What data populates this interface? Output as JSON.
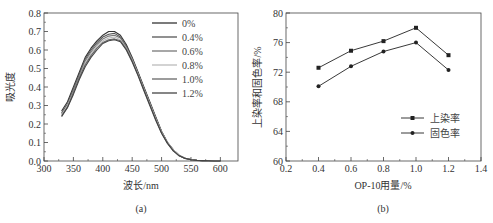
{
  "chart_data": [
    {
      "id": "a",
      "type": "line",
      "caption": "(a)",
      "title": "",
      "xlabel": "波长/nm",
      "ylabel": "吸光度",
      "xlim": [
        300,
        630
      ],
      "ylim": [
        0.0,
        0.8
      ],
      "xticks": [
        300,
        350,
        400,
        450,
        500,
        550,
        600
      ],
      "xtick_labels": [
        "300",
        "350",
        "400",
        "450",
        "500",
        "550",
        "600"
      ],
      "yticks": [
        0.0,
        0.1,
        0.2,
        0.3,
        0.4,
        0.5,
        0.6,
        0.7,
        0.8
      ],
      "ytick_labels": [
        "0.0",
        "0.1",
        "0.2",
        "0.3",
        "0.4",
        "0.5",
        "0.6",
        "0.7",
        "0.8"
      ],
      "grid": false,
      "legend_position": "upper right",
      "x": [
        330,
        340,
        350,
        360,
        370,
        380,
        390,
        400,
        410,
        420,
        430,
        440,
        450,
        460,
        470,
        480,
        490,
        500,
        510,
        520,
        530,
        540,
        550,
        560,
        570,
        580,
        590,
        600
      ],
      "series": [
        {
          "name": "0%",
          "color": "#333333",
          "values": [
            0.27,
            0.32,
            0.4,
            0.48,
            0.56,
            0.61,
            0.65,
            0.68,
            0.7,
            0.7,
            0.68,
            0.63,
            0.56,
            0.48,
            0.4,
            0.32,
            0.24,
            0.16,
            0.1,
            0.06,
            0.03,
            0.015,
            0.008,
            0.004,
            0.002,
            0.001,
            0.0,
            0.0
          ]
        },
        {
          "name": "0.4%",
          "color": "#555555",
          "values": [
            0.26,
            0.31,
            0.39,
            0.47,
            0.55,
            0.6,
            0.64,
            0.67,
            0.685,
            0.69,
            0.67,
            0.62,
            0.555,
            0.475,
            0.395,
            0.315,
            0.235,
            0.16,
            0.1,
            0.06,
            0.03,
            0.015,
            0.008,
            0.004,
            0.002,
            0.001,
            0.0,
            0.0
          ]
        },
        {
          "name": "0.6%",
          "color": "#777777",
          "values": [
            0.255,
            0.3,
            0.38,
            0.46,
            0.54,
            0.59,
            0.63,
            0.66,
            0.675,
            0.68,
            0.665,
            0.615,
            0.55,
            0.47,
            0.39,
            0.31,
            0.23,
            0.155,
            0.1,
            0.06,
            0.03,
            0.015,
            0.008,
            0.004,
            0.002,
            0.001,
            0.0,
            0.0
          ]
        },
        {
          "name": "0.8%",
          "color": "#bbbbbb",
          "values": [
            0.25,
            0.3,
            0.37,
            0.45,
            0.53,
            0.58,
            0.62,
            0.65,
            0.665,
            0.67,
            0.655,
            0.61,
            0.545,
            0.47,
            0.39,
            0.31,
            0.23,
            0.155,
            0.1,
            0.06,
            0.03,
            0.015,
            0.008,
            0.004,
            0.002,
            0.001,
            0.0,
            0.0
          ]
        },
        {
          "name": "1.0%",
          "color": "#666666",
          "values": [
            0.245,
            0.29,
            0.37,
            0.45,
            0.52,
            0.57,
            0.61,
            0.64,
            0.655,
            0.66,
            0.65,
            0.605,
            0.54,
            0.465,
            0.385,
            0.305,
            0.225,
            0.15,
            0.095,
            0.055,
            0.028,
            0.014,
            0.007,
            0.003,
            0.002,
            0.001,
            0.0,
            0.0
          ]
        },
        {
          "name": "1.2%",
          "color": "#444444",
          "values": [
            0.24,
            0.29,
            0.36,
            0.44,
            0.51,
            0.56,
            0.6,
            0.635,
            0.65,
            0.655,
            0.645,
            0.6,
            0.535,
            0.46,
            0.38,
            0.3,
            0.22,
            0.15,
            0.095,
            0.055,
            0.028,
            0.014,
            0.007,
            0.003,
            0.002,
            0.001,
            0.0,
            0.0
          ]
        }
      ]
    },
    {
      "id": "b",
      "type": "line",
      "caption": "(b)",
      "title": "",
      "xlabel": "OP-10用量/%",
      "ylabel": "上染率和固色率/%",
      "xlim": [
        0.2,
        1.4
      ],
      "ylim": [
        60,
        80
      ],
      "xticks": [
        0.2,
        0.4,
        0.6,
        0.8,
        1.0,
        1.2,
        1.4
      ],
      "xtick_labels": [
        "0.2",
        "0.4",
        "0.6",
        "0.8",
        "1.0",
        "1.2",
        "1.4"
      ],
      "yticks": [
        60,
        64,
        68,
        72,
        76,
        80
      ],
      "ytick_labels": [
        "60",
        "64",
        "68",
        "72",
        "76",
        "80"
      ],
      "grid": false,
      "legend_position": "lower right",
      "categories": [
        0.4,
        0.6,
        0.8,
        1.0,
        1.2
      ],
      "series": [
        {
          "name": "上染率",
          "marker": "square",
          "color": "#222222",
          "values": [
            72.6,
            74.9,
            76.2,
            78.0,
            74.3
          ]
        },
        {
          "name": "固色率",
          "marker": "circle",
          "color": "#222222",
          "values": [
            70.1,
            72.8,
            74.8,
            76.0,
            72.3
          ]
        }
      ]
    }
  ]
}
